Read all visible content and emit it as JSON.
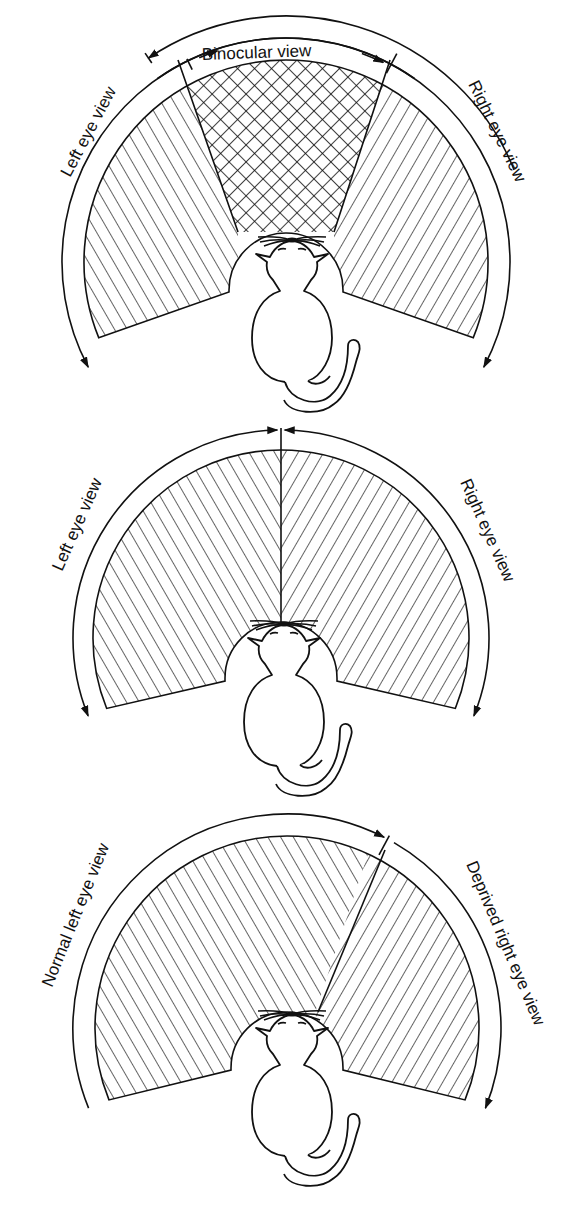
{
  "figure": {
    "panels": [
      {
        "id": "normal-overlapping",
        "labels": {
          "left": "Left eye view",
          "right": "Right eye view",
          "top": "Binocular view"
        },
        "regions": [
          "left-monocular-hatch",
          "binocular-crosshatch",
          "right-monocular-hatch"
        ]
      },
      {
        "id": "strabismic-split",
        "labels": {
          "left": "Left eye view",
          "right": "Right eye view"
        },
        "regions": [
          "left-hatch",
          "right-hatch"
        ]
      },
      {
        "id": "monocular-deprivation",
        "labels": {
          "left": "Normal left eye view",
          "right": "Deprived right eye view"
        },
        "regions": [
          "left-hatch-expanded",
          "right-hatch-reduced"
        ]
      }
    ],
    "colors": {
      "ink": "#111111",
      "background": "#ffffff"
    }
  }
}
